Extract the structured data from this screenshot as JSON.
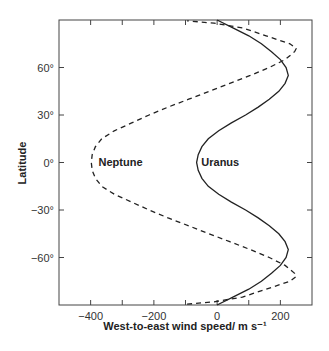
{
  "chart_data": {
    "type": "line",
    "title": "",
    "xlabel": "West-to-east wind speed/ m s⁻¹",
    "ylabel": "Latitude",
    "xlim": [
      -500,
      300
    ],
    "ylim": [
      -90,
      90
    ],
    "grid": false,
    "legend": "inline labels",
    "x_ticks": [
      -400,
      -300,
      -200,
      -100,
      0,
      100,
      200
    ],
    "x_tick_labels": [
      {
        "value": -400,
        "label": "−400"
      },
      {
        "value": -200,
        "label": "−200"
      },
      {
        "value": 0,
        "label": "0"
      },
      {
        "value": 200,
        "label": "200"
      }
    ],
    "y_ticks": [
      {
        "value": 60,
        "label": "60°"
      },
      {
        "value": 30,
        "label": "30°"
      },
      {
        "value": 0,
        "label": "0°"
      },
      {
        "value": -30,
        "label": "−30°"
      },
      {
        "value": -60,
        "label": "−60°"
      }
    ],
    "series": [
      {
        "name": "Uranus",
        "style": "solid",
        "color": "#222222",
        "label_position": {
          "speed": -50,
          "latitude": -1
        },
        "points": [
          {
            "lat": -90,
            "speed": 0
          },
          {
            "lat": -85,
            "speed": 50
          },
          {
            "lat": -80,
            "speed": 100
          },
          {
            "lat": -75,
            "speed": 140
          },
          {
            "lat": -70,
            "speed": 172
          },
          {
            "lat": -65,
            "speed": 200
          },
          {
            "lat": -60,
            "speed": 218
          },
          {
            "lat": -55,
            "speed": 225
          },
          {
            "lat": -50,
            "speed": 215
          },
          {
            "lat": -45,
            "speed": 195
          },
          {
            "lat": -40,
            "speed": 165
          },
          {
            "lat": -35,
            "speed": 130
          },
          {
            "lat": -30,
            "speed": 90
          },
          {
            "lat": -25,
            "speed": 45
          },
          {
            "lat": -20,
            "speed": 5
          },
          {
            "lat": -15,
            "speed": -28
          },
          {
            "lat": -10,
            "speed": -48
          },
          {
            "lat": -5,
            "speed": -60
          },
          {
            "lat": 0,
            "speed": -65
          },
          {
            "lat": 5,
            "speed": -60
          },
          {
            "lat": 10,
            "speed": -48
          },
          {
            "lat": 15,
            "speed": -28
          },
          {
            "lat": 20,
            "speed": 5
          },
          {
            "lat": 25,
            "speed": 45
          },
          {
            "lat": 30,
            "speed": 90
          },
          {
            "lat": 35,
            "speed": 130
          },
          {
            "lat": 40,
            "speed": 165
          },
          {
            "lat": 45,
            "speed": 195
          },
          {
            "lat": 50,
            "speed": 215
          },
          {
            "lat": 55,
            "speed": 225
          },
          {
            "lat": 60,
            "speed": 218
          },
          {
            "lat": 65,
            "speed": 200
          },
          {
            "lat": 70,
            "speed": 172
          },
          {
            "lat": 75,
            "speed": 140
          },
          {
            "lat": 80,
            "speed": 100
          },
          {
            "lat": 85,
            "speed": 50
          },
          {
            "lat": 90,
            "speed": 0
          }
        ]
      },
      {
        "name": "Neptune",
        "style": "dashed",
        "color": "#222222",
        "label_position": {
          "speed": -375,
          "latitude": -1
        },
        "points": [
          {
            "lat": -89.5,
            "speed": -95
          },
          {
            "lat": -88,
            "speed": -10
          },
          {
            "lat": -85,
            "speed": 80
          },
          {
            "lat": -80,
            "speed": 155
          },
          {
            "lat": -75,
            "speed": 230
          },
          {
            "lat": -72,
            "speed": 250
          },
          {
            "lat": -70,
            "speed": 245
          },
          {
            "lat": -65,
            "speed": 215
          },
          {
            "lat": -60,
            "speed": 165
          },
          {
            "lat": -55,
            "speed": 105
          },
          {
            "lat": -50,
            "speed": 40
          },
          {
            "lat": -45,
            "speed": -25
          },
          {
            "lat": -40,
            "speed": -90
          },
          {
            "lat": -35,
            "speed": -155
          },
          {
            "lat": -30,
            "speed": -215
          },
          {
            "lat": -25,
            "speed": -270
          },
          {
            "lat": -20,
            "speed": -325
          },
          {
            "lat": -15,
            "speed": -365
          },
          {
            "lat": -10,
            "speed": -385
          },
          {
            "lat": -5,
            "speed": -395
          },
          {
            "lat": 0,
            "speed": -398
          },
          {
            "lat": 5,
            "speed": -395
          },
          {
            "lat": 10,
            "speed": -385
          },
          {
            "lat": 15,
            "speed": -365
          },
          {
            "lat": 20,
            "speed": -325
          },
          {
            "lat": 25,
            "speed": -270
          },
          {
            "lat": 30,
            "speed": -215
          },
          {
            "lat": 35,
            "speed": -155
          },
          {
            "lat": 40,
            "speed": -90
          },
          {
            "lat": 45,
            "speed": -25
          },
          {
            "lat": 50,
            "speed": 40
          },
          {
            "lat": 55,
            "speed": 105
          },
          {
            "lat": 60,
            "speed": 165
          },
          {
            "lat": 65,
            "speed": 215
          },
          {
            "lat": 70,
            "speed": 245
          },
          {
            "lat": 72,
            "speed": 250
          },
          {
            "lat": 75,
            "speed": 230
          },
          {
            "lat": 80,
            "speed": 155
          },
          {
            "lat": 85,
            "speed": 80
          },
          {
            "lat": 88,
            "speed": -10
          },
          {
            "lat": 89.5,
            "speed": -95
          }
        ]
      }
    ]
  }
}
